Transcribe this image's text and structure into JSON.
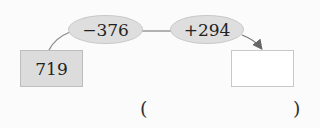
{
  "diagram": {
    "start_value": "719",
    "operations": [
      {
        "label": "−376"
      },
      {
        "label": "+294"
      }
    ],
    "result_value": "",
    "answer_blank": {
      "open": "(",
      "close": ")",
      "value": ""
    }
  },
  "colors": {
    "box_fill": "#dcdcdc",
    "ellipse_fill": "#dedede",
    "line": "#777777"
  }
}
